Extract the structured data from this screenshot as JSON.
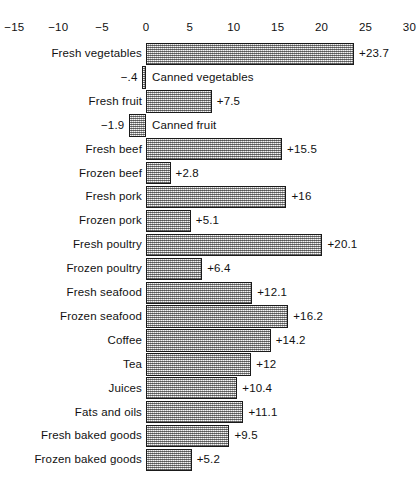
{
  "chart_data": {
    "type": "bar",
    "orientation": "horizontal",
    "title": "",
    "subtitle": "",
    "xlabel": "",
    "ylabel": "",
    "xlim": [
      -15,
      30
    ],
    "xticks": [
      -15,
      -10,
      -5,
      0,
      5,
      10,
      15,
      20,
      25,
      30
    ],
    "xtick_labels": [
      "−15",
      "−10",
      "−5",
      "0",
      "5",
      "10",
      "15",
      "20",
      "25",
      "30"
    ],
    "grid": false,
    "legend": null,
    "categories": [
      "Fresh vegetables",
      "Canned vegetables",
      "Fresh fruit",
      "Canned fruit",
      "Fresh beef",
      "Frozen beef",
      "Fresh pork",
      "Frozen pork",
      "Fresh poultry",
      "Frozen poultry",
      "Fresh seafood",
      "Frozen seafood",
      "Coffee",
      "Tea",
      "Juices",
      "Fats and oils",
      "Fresh baked goods",
      "Frozen baked goods"
    ],
    "values": [
      23.7,
      -0.4,
      7.5,
      -1.9,
      15.5,
      2.8,
      16,
      5.1,
      20.1,
      6.4,
      12.1,
      16.2,
      14.2,
      12,
      10.4,
      11.1,
      9.5,
      5.2
    ],
    "value_labels": [
      "+23.7",
      "−.4",
      "+7.5",
      "−1.9",
      "+15.5",
      "+2.8",
      "+16",
      "+5.1",
      "+20.1",
      "+6.4",
      "+12.1",
      "+16.2",
      "+14.2",
      "+12",
      "+10.4",
      "+11.1",
      "+9.5",
      "+5.2"
    ],
    "bar_fill": "#bdbdbd",
    "bar_edge": "#1a1a1a",
    "rows": [
      {
        "label": "Fresh vegetables",
        "value": 23.7,
        "value_label": "+23.7"
      },
      {
        "label": "Canned vegetables",
        "value": -0.4,
        "value_label": "−.4"
      },
      {
        "label": "Fresh fruit",
        "value": 7.5,
        "value_label": "+7.5"
      },
      {
        "label": "Canned fruit",
        "value": -1.9,
        "value_label": "−1.9"
      },
      {
        "label": "Fresh beef",
        "value": 15.5,
        "value_label": "+15.5"
      },
      {
        "label": "Frozen beef",
        "value": 2.8,
        "value_label": "+2.8"
      },
      {
        "label": "Fresh pork",
        "value": 16,
        "value_label": "+16"
      },
      {
        "label": "Frozen pork",
        "value": 5.1,
        "value_label": "+5.1"
      },
      {
        "label": "Fresh poultry",
        "value": 20.1,
        "value_label": "+20.1"
      },
      {
        "label": "Frozen poultry",
        "value": 6.4,
        "value_label": "+6.4"
      },
      {
        "label": "Fresh seafood",
        "value": 12.1,
        "value_label": "+12.1"
      },
      {
        "label": "Frozen seafood",
        "value": 16.2,
        "value_label": "+16.2"
      },
      {
        "label": "Coffee",
        "value": 14.2,
        "value_label": "+14.2"
      },
      {
        "label": "Tea",
        "value": 12,
        "value_label": "+12"
      },
      {
        "label": "Juices",
        "value": 10.4,
        "value_label": "+10.4"
      },
      {
        "label": "Fats and oils",
        "value": 11.1,
        "value_label": "+11.1"
      },
      {
        "label": "Fresh baked goods",
        "value": 9.5,
        "value_label": "+9.5"
      },
      {
        "label": "Frozen baked goods",
        "value": 5.2,
        "value_label": "+5.2"
      }
    ]
  },
  "layout": {
    "zero_x_px": 146,
    "px_per_unit": 8.78,
    "row_height_px": 23.9,
    "plot_top_px": 42
  }
}
